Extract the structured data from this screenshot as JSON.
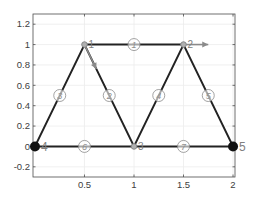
{
  "figure": {
    "type": "truss-diagram",
    "axes": {
      "xlim": [
        -0.02,
        2.02
      ],
      "ylim": [
        -0.3,
        1.3
      ],
      "grid": true,
      "box": true,
      "xticks": [
        {
          "value": 0.5,
          "label": "0.5"
        },
        {
          "value": 1,
          "label": "1"
        },
        {
          "value": 1.5,
          "label": "1.5"
        },
        {
          "value": 2,
          "label": "2"
        }
      ],
      "yticks": [
        {
          "value": 1.2,
          "label": "1.2"
        },
        {
          "value": 1,
          "label": "1"
        },
        {
          "value": 0.8,
          "label": "0.8"
        },
        {
          "value": 0.6,
          "label": "0.6"
        },
        {
          "value": 0.4,
          "label": "0.4"
        },
        {
          "value": 0.2,
          "label": "0.2"
        },
        {
          "value": 0,
          "label": "0"
        },
        {
          "value": -0.2,
          "label": "-0.2"
        }
      ]
    },
    "colors": {
      "member": "#222222",
      "free_node": "#888888",
      "support_node": "#111111",
      "load_arrow": "#8a8a8a",
      "label": "#8a8a8a",
      "support_label": "#222222",
      "grid": "#ececec",
      "axis": "#4d4d4d"
    },
    "nodes": [
      {
        "id": "1",
        "label": "1",
        "x": 0.5,
        "y": 1.0,
        "support": false
      },
      {
        "id": "2",
        "label": "2",
        "x": 1.5,
        "y": 1.0,
        "support": false
      },
      {
        "id": "3",
        "label": "3",
        "x": 1.0,
        "y": 0.0,
        "support": false
      },
      {
        "id": "4",
        "label": "4",
        "x": 0.0,
        "y": 0.0,
        "support": true
      },
      {
        "id": "5",
        "label": "5",
        "x": 2.0,
        "y": 0.0,
        "support": true
      }
    ],
    "elements": [
      {
        "id": "1",
        "label": "1",
        "from": "1",
        "to": "2"
      },
      {
        "id": "2",
        "label": "2",
        "from": "1",
        "to": "3"
      },
      {
        "id": "3",
        "label": "3",
        "from": "4",
        "to": "1"
      },
      {
        "id": "4",
        "label": "4",
        "from": "3",
        "to": "2"
      },
      {
        "id": "5",
        "label": "5",
        "from": "2",
        "to": "5"
      },
      {
        "id": "6",
        "label": "6",
        "from": "4",
        "to": "3"
      },
      {
        "id": "7",
        "label": "7",
        "from": "3",
        "to": "5"
      }
    ],
    "loads": [
      {
        "node": "1",
        "dx": 0.12,
        "dy": -0.24
      },
      {
        "node": "2",
        "dx": 0.25,
        "dy": 0.0
      }
    ]
  }
}
